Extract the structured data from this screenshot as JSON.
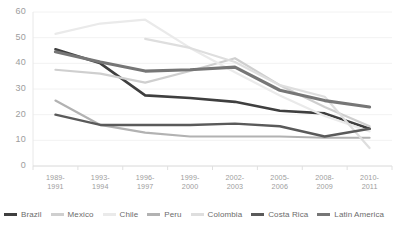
{
  "chart_data": {
    "type": "line",
    "title": "",
    "xlabel": "",
    "ylabel": "",
    "ylim": [
      0,
      60
    ],
    "yticks": [
      0,
      10,
      20,
      30,
      40,
      50,
      60
    ],
    "grid": true,
    "grid_axis": "y",
    "legend_position": "bottom",
    "categories": [
      "1989-\n1991",
      "1993-\n1994",
      "1996-\n1997",
      "1999-\n2000",
      "2002-\n2003",
      "2005-\n2006",
      "2008-\n2009",
      "2010-\n2011"
    ],
    "series": [
      {
        "name": "Brazil",
        "color": "#3f3f3f",
        "width": 2.6,
        "values": [
          45.5,
          40.0,
          27.5,
          26.5,
          25.0,
          21.5,
          20.5,
          14.5
        ]
      },
      {
        "name": "Mexico",
        "color": "#cfcfcf",
        "width": 2.2,
        "values": [
          37.5,
          36.0,
          32.5,
          37.0,
          42.0,
          31.5,
          23.0,
          15.5
        ]
      },
      {
        "name": "Chile",
        "color": "#eaeaea",
        "width": 2.2,
        "values": [
          51.5,
          55.5,
          57.0,
          46.0,
          36.5,
          27.5,
          19.5,
          13.5
        ]
      },
      {
        "name": "Peru",
        "color": "#b2b2b2",
        "width": 2.2,
        "values": [
          25.5,
          16.0,
          13.0,
          11.5,
          11.5,
          11.5,
          11.0,
          11.0
        ]
      },
      {
        "name": "Colombia",
        "color": "#dedede",
        "width": 2.2,
        "values": [
          null,
          null,
          49.5,
          46.0,
          40.5,
          31.5,
          27.0,
          7.0
        ]
      },
      {
        "name": "Costa Rica",
        "color": "#5a5a5a",
        "width": 2.4,
        "values": [
          20.0,
          16.0,
          16.0,
          16.0,
          16.5,
          15.5,
          11.5,
          14.5
        ]
      },
      {
        "name": "Latin America",
        "color": "#767676",
        "width": 3.2,
        "values": [
          44.5,
          40.5,
          37.0,
          37.5,
          38.5,
          29.5,
          25.5,
          23.0
        ]
      }
    ]
  },
  "axis": {
    "ytick_labels": [
      "60",
      "50",
      "40",
      "30",
      "20",
      "10",
      "0"
    ]
  },
  "legend": {
    "items": [
      {
        "label": "Brazil",
        "color": "#3f3f3f"
      },
      {
        "label": "Mexico",
        "color": "#cfcfcf"
      },
      {
        "label": "Chile",
        "color": "#eaeaea"
      },
      {
        "label": "Peru",
        "color": "#b2b2b2"
      },
      {
        "label": "Colombia",
        "color": "#dedede"
      },
      {
        "label": "Costa Rica",
        "color": "#5a5a5a"
      },
      {
        "label": "Latin America",
        "color": "#767676"
      }
    ]
  }
}
